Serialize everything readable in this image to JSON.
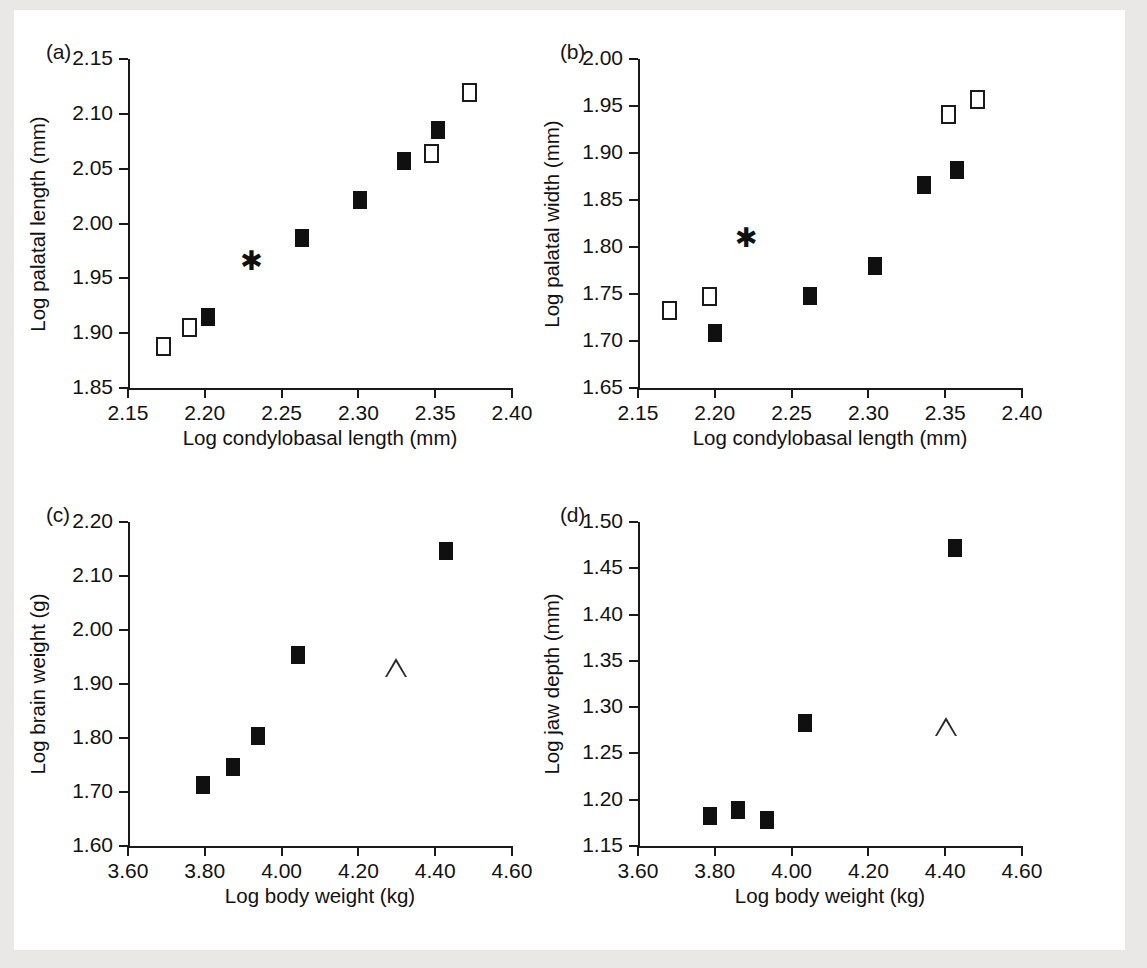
{
  "figure": {
    "background_color": "#ffffff",
    "axis_color": "#1a1a1a",
    "marker_fill_color": "#101010",
    "marker_open_color": "#ffffff"
  },
  "panels": [
    {
      "id": "a",
      "label": "(a)",
      "chart_data": {
        "type": "scatter",
        "title": "",
        "xlabel": "Log condylobasal length (mm)",
        "ylabel": "Log palatal length (mm)",
        "xlim": [
          2.15,
          2.4
        ],
        "ylim": [
          1.85,
          2.15
        ],
        "xticks": [
          "2.15",
          "2.20",
          "2.25",
          "2.30",
          "2.35",
          "2.40"
        ],
        "yticks": [
          "1.85",
          "1.90",
          "1.95",
          "2.00",
          "2.05",
          "2.10",
          "2.15"
        ],
        "grid": false,
        "legend": "none",
        "series": [
          {
            "name": "open-square",
            "marker": "open-square",
            "points": [
              {
                "x": 2.173,
                "y": 1.888
              },
              {
                "x": 2.19,
                "y": 1.906
              },
              {
                "x": 2.347,
                "y": 2.064
              },
              {
                "x": 2.372,
                "y": 2.12
              }
            ]
          },
          {
            "name": "filled-square",
            "marker": "filled-square",
            "points": [
              {
                "x": 2.202,
                "y": 1.915
              },
              {
                "x": 2.263,
                "y": 1.987
              },
              {
                "x": 2.301,
                "y": 2.021
              },
              {
                "x": 2.33,
                "y": 2.057
              },
              {
                "x": 2.352,
                "y": 2.085
              }
            ]
          },
          {
            "name": "asterisk",
            "marker": "asterisk",
            "points": [
              {
                "x": 2.229,
                "y": 1.961
              }
            ]
          }
        ]
      }
    },
    {
      "id": "b",
      "label": "(b)",
      "chart_data": {
        "type": "scatter",
        "title": "",
        "xlabel": "Log condylobasal length (mm)",
        "ylabel": "Log palatal width (mm)",
        "xlim": [
          2.15,
          2.4
        ],
        "ylim": [
          1.65,
          2.0
        ],
        "xticks": [
          "2.15",
          "2.20",
          "2.25",
          "2.30",
          "2.35",
          "2.40"
        ],
        "yticks": [
          "1.65",
          "1.70",
          "1.75",
          "1.80",
          "1.85",
          "1.90",
          "1.95",
          "2.00"
        ],
        "grid": false,
        "legend": "none",
        "series": [
          {
            "name": "open-square",
            "marker": "open-square",
            "points": [
              {
                "x": 2.17,
                "y": 1.733
              },
              {
                "x": 2.196,
                "y": 1.748
              },
              {
                "x": 2.352,
                "y": 1.942
              },
              {
                "x": 2.371,
                "y": 1.957
              }
            ]
          },
          {
            "name": "filled-square",
            "marker": "filled-square",
            "points": [
              {
                "x": 2.2,
                "y": 1.709
              },
              {
                "x": 2.262,
                "y": 1.748
              },
              {
                "x": 2.304,
                "y": 1.78
              },
              {
                "x": 2.336,
                "y": 1.866
              },
              {
                "x": 2.358,
                "y": 1.882
              }
            ]
          },
          {
            "name": "asterisk",
            "marker": "asterisk",
            "points": [
              {
                "x": 2.219,
                "y": 1.804
              }
            ]
          }
        ]
      }
    },
    {
      "id": "c",
      "label": "(c)",
      "chart_data": {
        "type": "scatter",
        "title": "",
        "xlabel": "Log body weight (kg)",
        "ylabel": "Log brain weight (g)",
        "xlim": [
          3.6,
          4.6
        ],
        "ylim": [
          1.6,
          2.2
        ],
        "xticks": [
          "3.60",
          "3.80",
          "4.00",
          "4.20",
          "4.40",
          "4.60"
        ],
        "yticks": [
          "1.60",
          "1.70",
          "1.80",
          "1.90",
          "2.00",
          "2.10",
          "2.20"
        ],
        "grid": false,
        "legend": "none",
        "series": [
          {
            "name": "filled-square",
            "marker": "filled-square",
            "points": [
              {
                "x": 3.795,
                "y": 1.713
              },
              {
                "x": 3.874,
                "y": 1.747
              },
              {
                "x": 3.938,
                "y": 1.803
              },
              {
                "x": 4.042,
                "y": 1.954
              },
              {
                "x": 4.428,
                "y": 2.147
              }
            ]
          },
          {
            "name": "open-triangle",
            "marker": "open-triangle",
            "points": [
              {
                "x": 4.297,
                "y": 1.929
              }
            ]
          }
        ]
      }
    },
    {
      "id": "d",
      "label": "(d)",
      "chart_data": {
        "type": "scatter",
        "title": "",
        "xlabel": "Log body weight (kg)",
        "ylabel": "Log jaw depth (mm)",
        "xlim": [
          3.6,
          4.6
        ],
        "ylim": [
          1.15,
          1.5
        ],
        "xticks": [
          "3.60",
          "3.80",
          "4.00",
          "4.20",
          "4.40",
          "4.60"
        ],
        "yticks": [
          "1.15",
          "1.20",
          "1.25",
          "1.30",
          "1.35",
          "1.40",
          "1.45",
          "1.50"
        ],
        "grid": false,
        "legend": "none",
        "series": [
          {
            "name": "filled-square",
            "marker": "filled-square",
            "points": [
              {
                "x": 3.787,
                "y": 1.182
              },
              {
                "x": 3.86,
                "y": 1.189
              },
              {
                "x": 3.936,
                "y": 1.178
              },
              {
                "x": 4.035,
                "y": 1.283
              },
              {
                "x": 4.425,
                "y": 1.472
              }
            ]
          },
          {
            "name": "open-triangle",
            "marker": "open-triangle",
            "points": [
              {
                "x": 4.402,
                "y": 1.279
              }
            ]
          }
        ]
      }
    }
  ]
}
